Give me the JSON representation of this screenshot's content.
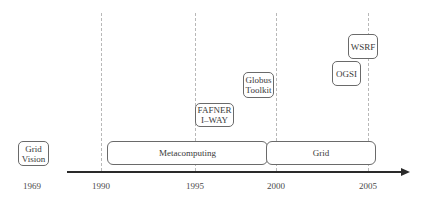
{
  "diagram": {
    "type": "timeline",
    "years": [
      {
        "label": "1969",
        "x": 32
      },
      {
        "label": "1990",
        "x": 101
      },
      {
        "label": "1995",
        "x": 195
      },
      {
        "label": "2000",
        "x": 276
      },
      {
        "label": "2005",
        "x": 368
      }
    ],
    "periods": [
      {
        "label": "Metacomputing",
        "start": "1990",
        "end": "2000"
      },
      {
        "label": "Grid",
        "start": "2000",
        "end": "2005"
      }
    ],
    "events": [
      {
        "id": "grid-vision",
        "lines": [
          "Grid",
          "Vision"
        ],
        "year": "1969"
      },
      {
        "id": "fafner-iway",
        "lines": [
          "FAFNER",
          "I–WAY"
        ],
        "year": "1995"
      },
      {
        "id": "globus-toolkit",
        "lines": [
          "Globus",
          "Toolkit"
        ],
        "year": "1998"
      },
      {
        "id": "ogsi",
        "lines": [
          "OGSI"
        ],
        "year": "2003"
      },
      {
        "id": "wsrf",
        "lines": [
          "WSRF"
        ],
        "year": "2004"
      }
    ],
    "colors": {
      "axis": "#2a2a2a",
      "box_border": "#6a6a6a",
      "gridline": "#b8b8b8",
      "text": "#3a3a3a"
    }
  }
}
